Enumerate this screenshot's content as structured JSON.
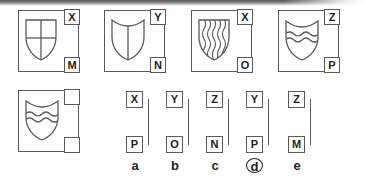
{
  "puzzle": {
    "type": "abstract-reasoning-matrix",
    "top_row": [
      {
        "id": "panel-1",
        "shield": "shield-quartered-cross",
        "top_label": "X",
        "bottom_label": "M"
      },
      {
        "id": "panel-2",
        "shield": "shield-plain-pale",
        "top_label": "Y",
        "bottom_label": "N"
      },
      {
        "id": "panel-3",
        "shield": "shield-paly-wavy",
        "top_label": "X",
        "bottom_label": "O"
      },
      {
        "id": "panel-4",
        "shield": "shield-barry-wavy",
        "top_label": "Z",
        "bottom_label": "P"
      }
    ],
    "question_panel": {
      "id": "panel-question",
      "shield": "shield-barry-wavy",
      "top_label": "",
      "bottom_label": ""
    },
    "options": [
      {
        "letter": "a",
        "top_label": "X",
        "bottom_label": "P",
        "selected": false
      },
      {
        "letter": "b",
        "top_label": "Y",
        "bottom_label": "O",
        "selected": false
      },
      {
        "letter": "c",
        "top_label": "Z",
        "bottom_label": "N",
        "selected": false
      },
      {
        "letter": "d",
        "top_label": "Y",
        "bottom_label": "P",
        "selected": true
      },
      {
        "letter": "e",
        "top_label": "Z",
        "bottom_label": "M",
        "selected": false
      }
    ],
    "colors": {
      "stroke": "#58595b",
      "text": "#231f20",
      "background": "#ffffff"
    }
  }
}
